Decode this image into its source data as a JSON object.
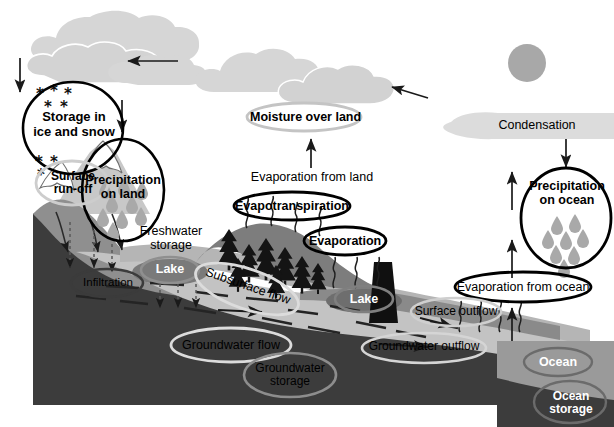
{
  "diagram": {
    "type": "hydrological-cycle-diagram"
  },
  "palette": {
    "cloud": "#d6d6d6",
    "sun": "#a8a8a8",
    "sky": "#ffffff",
    "bedrock": "#3a3a3a",
    "aquifer": "#b9b9b9",
    "terrain_mid": "#8d8d8d",
    "terrain_light": "#c2c2c2",
    "snowcap": "#ffffff",
    "ocean": "#9a9a9a",
    "dam": "#111111",
    "ink": "#000000",
    "grayline": "#9e9e9e",
    "droplet": "#a9a9a9"
  },
  "labels": {
    "storage_ice_snow": "Storage in\nice and snow",
    "storage_ice_snow_l1": "Storage in",
    "storage_ice_snow_l2": "ice and snow",
    "precipitation_on_land_l1": "Precipitation",
    "precipitation_on_land_l2": "on land",
    "surface_runoff_l1": "Surface",
    "surface_runoff_l2": "run-off",
    "moisture_over_land": "Moisture over land",
    "evaporation_from_land": "Evaporation from land",
    "evapotranspiration": "Evapotranspiration",
    "evaporation": "Evaporation",
    "condensation": "Condensation",
    "precipitation_on_ocean_l1": "Precipitation",
    "precipitation_on_ocean_l2": "on ocean",
    "evaporation_from_ocean": "Evaporation from ocean",
    "freshwater_storage_l1": "Freshwater",
    "freshwater_storage_l2": "storage",
    "lake_left": "Lake",
    "lake_right": "Lake",
    "infiltration": "Infiltration",
    "subsurface_flow": "Subsurface flow",
    "groundwater_flow": "Groundwater flow",
    "groundwater_storage_l1": "Groundwater",
    "groundwater_storage_l2": "storage",
    "groundwater_outflow": "Groundwater outflow",
    "surface_outflow": "Surface outflow",
    "ocean": "Ocean",
    "ocean_storage_l1": "Ocean",
    "ocean_storage_l2": "storage"
  },
  "icons": {
    "cloud": "cloud-icon",
    "sun": "sun-icon",
    "snowflake": "snowflake-icon",
    "raindrop": "raindrop-icon",
    "conifer": "conifer-tree-icon",
    "dam": "dam-icon",
    "arrow_down": "arrow-down-icon",
    "arrow_up": "arrow-up-icon",
    "arrow_left": "arrow-left-icon",
    "vapor_squiggle": "vapor-squiggle-icon"
  },
  "counts": {
    "clouds": 5,
    "snowflakes_upper": 5,
    "snowflakes_lower": 3,
    "raindrops_land": 9,
    "raindrops_ocean": 8,
    "conifer_trees": 8,
    "vapor_squiggles_trees": 4,
    "vapor_squiggles_lake": 3,
    "vapor_squiggles_ocean": 4,
    "infiltration_arrows": 3,
    "aquifer_dashes": 14
  }
}
